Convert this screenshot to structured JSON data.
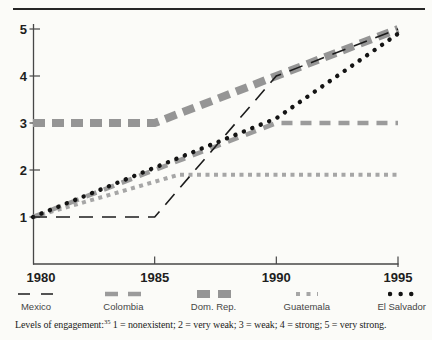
{
  "figure": {
    "background": "#fbfbf8",
    "top_rule_color": "#262626"
  },
  "chart_data": {
    "type": "line",
    "title": "",
    "xlabel": "",
    "ylabel": "",
    "grid": false,
    "legend_position": "bottom",
    "xlim": [
      1980,
      1995
    ],
    "ylim": [
      0,
      5
    ],
    "x_ticks": [
      "1980",
      "1985",
      "1990",
      "1995"
    ],
    "x_tick_values": [
      1980,
      1985,
      1990,
      1995
    ],
    "y_ticks": [
      "1",
      "2",
      "3",
      "4",
      "5"
    ],
    "y_tick_values": [
      1,
      2,
      3,
      4,
      5
    ],
    "series": [
      {
        "name": "Mexico",
        "style": "thin-black-dash",
        "color": "#1c1c1c",
        "points": [
          [
            1980,
            1
          ],
          [
            1985,
            1
          ],
          [
            1990,
            4
          ],
          [
            1995,
            5
          ]
        ]
      },
      {
        "name": "Colombia",
        "style": "gray-dash",
        "color": "#9b9b9b",
        "points": [
          [
            1980,
            1
          ],
          [
            1990,
            3
          ],
          [
            1995,
            3
          ]
        ]
      },
      {
        "name": "Dom. Rep.",
        "style": "thick-gray-dash",
        "color": "#959595",
        "points": [
          [
            1980,
            3
          ],
          [
            1985,
            3
          ],
          [
            1990,
            4
          ],
          [
            1995,
            5
          ]
        ]
      },
      {
        "name": "Guatemala",
        "style": "gray-square-dot",
        "color": "#a6a6a6",
        "points": [
          [
            1980,
            1
          ],
          [
            1986,
            1.9
          ],
          [
            1995,
            1.9
          ]
        ]
      },
      {
        "name": "El Salvador",
        "style": "black-dot",
        "color": "#141414",
        "points": [
          [
            1980,
            1
          ],
          [
            1990,
            3.1
          ],
          [
            1995,
            4.9
          ]
        ]
      }
    ]
  },
  "footnote": {
    "prefix": "Levels of engagement:",
    "ref": "35",
    "text": "1 = nonexistent; 2 = very weak; 3 = weak; 4 = strong; 5 = very strong."
  }
}
